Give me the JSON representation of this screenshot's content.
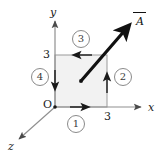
{
  "figure": {
    "axes": {
      "x_label": "x",
      "y_label": "y",
      "z_label": "z",
      "origin_label": "O"
    },
    "ticks": {
      "x_tick": "3",
      "y_tick": "3"
    },
    "vector": {
      "label": "A",
      "overbar": "vector-arrow"
    },
    "segments": [
      {
        "id": "1",
        "label": "1",
        "position": "bottom",
        "direction": "right"
      },
      {
        "id": "2",
        "label": "2",
        "position": "right",
        "direction": "up"
      },
      {
        "id": "3",
        "label": "3",
        "position": "top",
        "direction": "left"
      },
      {
        "id": "4",
        "label": "4",
        "position": "left",
        "direction": "down"
      }
    ],
    "colors": {
      "square_fill": "#f2f2f2",
      "square_stroke": "#9a9a9a",
      "axis_stroke": "#8f8f8f",
      "vector_stroke": "#111111",
      "text": "#1a1a1a",
      "circle_stroke": "#8a8a8a"
    },
    "geometry": {
      "origin_px": [
        55,
        107
      ],
      "square_size_px": 52,
      "center_dot_px": [
        81,
        81
      ]
    }
  }
}
